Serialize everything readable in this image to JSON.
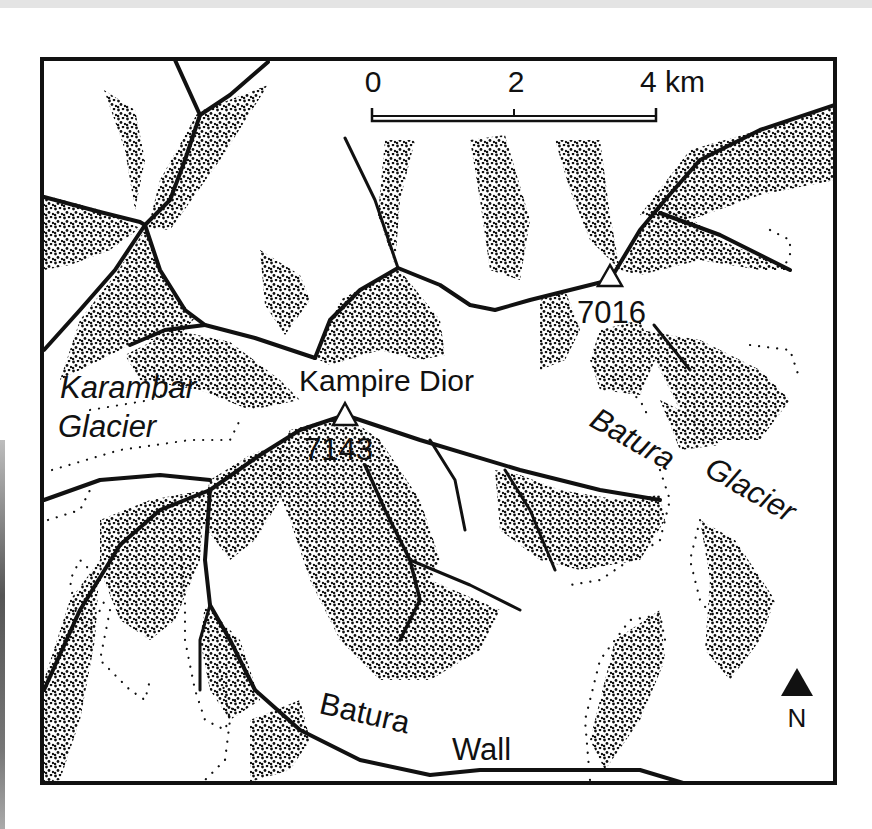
{
  "map": {
    "scale_bar": {
      "ticks": [
        "0",
        "2",
        "4 km"
      ],
      "unit": "km"
    },
    "peaks": [
      {
        "name": "Kampire Dior",
        "elevation": "7143"
      },
      {
        "name": "",
        "elevation": "7016"
      }
    ],
    "labels": {
      "karambar_1": "Karambar",
      "karambar_2": "Glacier",
      "kampire_dior": "Kampire Dior",
      "batura_glacier_1": "Batura",
      "batura_glacier_2": "Glacier",
      "batura_wall_1": "Batura",
      "batura_wall_2": "Wall"
    },
    "north_arrow": {
      "label": "N",
      "icon": "north-arrow-icon"
    },
    "colors": {
      "ink": "#111111",
      "paper": "#ffffff"
    }
  }
}
